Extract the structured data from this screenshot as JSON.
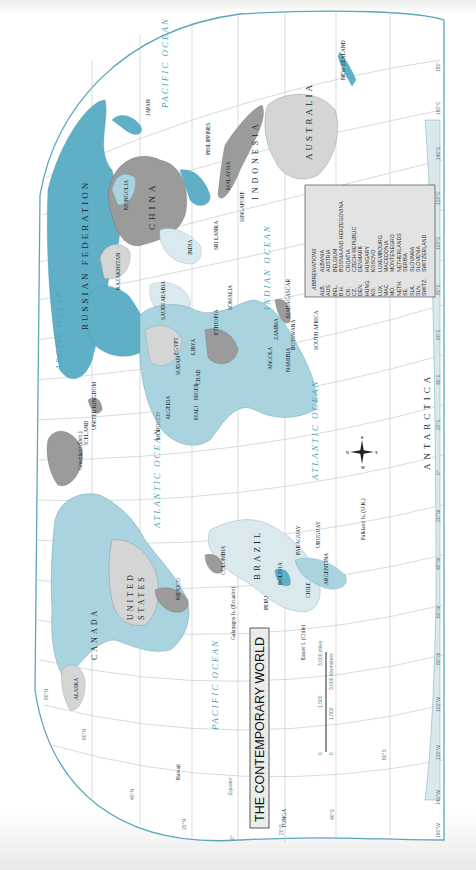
{
  "map": {
    "title": "THE CONTEMPORARY WORLD",
    "orientation": "rotated 90° clockwise (north points left)",
    "colors": {
      "ocean_outline": "#5aa6bd",
      "land_blue": "#5fb0c7",
      "land_lightblue": "#a9d3df",
      "land_pale": "#d9e9ee",
      "land_gray": "#9b9b9b",
      "land_lightgray": "#d4d6d6",
      "graticule": "#b9c4c6",
      "ocean_label": "#4fa2bd"
    },
    "oceans": [
      {
        "name": "PACIFIC OCEAN",
        "position": "east"
      },
      {
        "name": "PACIFIC OCEAN",
        "position": "west"
      },
      {
        "name": "ATLANTIC OCEAN",
        "position": "north"
      },
      {
        "name": "ATLANTIC OCEAN",
        "position": "south"
      },
      {
        "name": "INDIAN OCEAN"
      },
      {
        "name": "ARCTIC OCEAN"
      }
    ],
    "continents_large_labels": [
      "RUSSIAN FEDERATION",
      "CHINA",
      "AUSTRALIA",
      "INDONESIA",
      "CANADA",
      "UNITED STATES",
      "BRAZIL",
      "ANTARCTICA"
    ],
    "country_labels": [
      "JAPAN",
      "N. KOREA",
      "KOREA",
      "MONGOLIA",
      "KAZAKHSTAN",
      "INDIA",
      "BHUTAN",
      "NEPAL",
      "BANGLADESH",
      "MYANMAR (BURMA)",
      "LAOS",
      "THAILAND",
      "CAMBODIA",
      "VIETNAM",
      "MALAYSIA",
      "BRUNEI",
      "PHILIPPINES",
      "PALAU",
      "SINGAPORE",
      "SRI LANKA",
      "MALDIVES",
      "TIMOR-LESTE",
      "PAPUA NEW GUINEA",
      "NEW ZEALAND",
      "SOLOMON IS.",
      "VANUATU",
      "FIJI",
      "TUVALU",
      "KIRIBATI",
      "NAURU",
      "MARSHALL IS.",
      "FEDERATED STATES OF MICRONESIA",
      "OMAN",
      "UNITED ARAB EMIRATES",
      "SAUDI ARABIA",
      "YEMEN",
      "IRAN",
      "IRAQ",
      "TURKEY",
      "SYRIA",
      "EGYPT",
      "LIBYA",
      "SUDAN",
      "ETHIOPIA",
      "SOMALIA",
      "KENYA",
      "TANZANIA",
      "CHAD",
      "NIGER",
      "MALI",
      "ALGERIA",
      "MOROCCO",
      "TUNISIA",
      "MAURITANIA",
      "NIGERIA",
      "ANGOLA",
      "ZAMBIA",
      "ZIMBABWE",
      "MOZAMBIQUE",
      "MADAGASCAR",
      "BOTSWANA",
      "NAMIBIA",
      "SOUTH AFRICA",
      "SWAZILAND",
      "LESOTHO",
      "MALAWI",
      "MAURITIUS",
      "SEYCHELLES",
      "GHANA",
      "LIBERIA",
      "SIERRA LEONE",
      "GUINEA",
      "SENEGAL",
      "CAPE VERDE",
      "CÔTE D'IVOIRE",
      "BURKINA FASO",
      "DEM. REP. OF THE CONGO",
      "ICELAND",
      "IRELAND",
      "UNITED KINGDOM",
      "NORWAY",
      "SWEDEN",
      "FINLAND",
      "SPAIN",
      "PORTUGAL",
      "FRANCE",
      "MEXICO",
      "CUBA",
      "HAITI",
      "DOMINICAN REPUBLIC",
      "JAMAICA",
      "GUATEMALA",
      "EL SALVADOR",
      "HONDURAS",
      "COSTA RICA",
      "PANAMA",
      "COLOMBIA",
      "VENEZUELA",
      "GUYANA",
      "SURINAME",
      "ECUADOR",
      "PERU",
      "BOLIVIA",
      "PARAGUAY",
      "CHILE",
      "ARGENTINA",
      "URUGUAY",
      "ALASKA",
      "SAMOA",
      "TONGA",
      "Greenland (Den.)",
      "Western Sahara",
      "Canary Is. (Sp.)",
      "Azores (Port.)",
      "French Guiana (Fr.)",
      "Falkland Is. (U.K.)",
      "Galapagos Is. (Ecuador)",
      "Easter I. (Chile)",
      "Hawaii",
      "Guam (U.S.)",
      "Mariana Is. (U.S.)",
      "New Caledonia (Fr.)",
      "Tasmania (AUST.)",
      "Taiwan"
    ],
    "abbreviations": {
      "heading": "ABBREVIATIONS",
      "items": [
        {
          "code": "ALB.",
          "name": "ALBANIA"
        },
        {
          "code": "AUS.",
          "name": "AUSTRIA"
        },
        {
          "code": "BEL.",
          "name": "BELGIUM"
        },
        {
          "code": "B.H.",
          "name": "BOSNIA AND HERZEGOVINA"
        },
        {
          "code": "CR.",
          "name": "CROATIA"
        },
        {
          "code": "CZ.",
          "name": "CZECH REPUBLIC"
        },
        {
          "code": "DEN.",
          "name": "DENMARK"
        },
        {
          "code": "HUNG.",
          "name": "HUNGARY"
        },
        {
          "code": "KO.",
          "name": "KOSOVO"
        },
        {
          "code": "LUX.",
          "name": "LUXEMBOURG"
        },
        {
          "code": "MAC.",
          "name": "MACEDONIA"
        },
        {
          "code": "MO.",
          "name": "MONTENEGRO"
        },
        {
          "code": "NETH.",
          "name": "NETHERLANDS"
        },
        {
          "code": "SE.",
          "name": "SERBIA"
        },
        {
          "code": "SLK.",
          "name": "SLOVAKIA"
        },
        {
          "code": "SLN.",
          "name": "SLOVENIA"
        },
        {
          "code": "SWITZ.",
          "name": "SWITZERLAND"
        }
      ]
    },
    "scale_bar": {
      "miles": [
        "0",
        "1,500",
        "3,000 miles"
      ],
      "kilometers": [
        "0",
        "1,500",
        "3,000 kilometers"
      ]
    },
    "graticule": {
      "longitudes": [
        "160°W",
        "140°W",
        "120°W",
        "100°W",
        "80°W",
        "60°W",
        "40°W",
        "20°W",
        "0°",
        "20°E",
        "40°E",
        "60°E",
        "80°E",
        "100°E",
        "120°E",
        "140°E",
        "160°E",
        "180°"
      ],
      "latitudes": [
        "80°N",
        "60°N",
        "40°N",
        "20°N",
        "0°",
        "20°S",
        "40°S",
        "60°S"
      ],
      "equator_label": "Equator"
    },
    "compass": {
      "labels": [
        "N",
        "E",
        "S",
        "W"
      ]
    }
  }
}
